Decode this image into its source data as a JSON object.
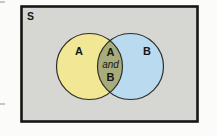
{
  "diagram": {
    "type": "venn-2-set",
    "sample_space_label": "S",
    "set_a_label": "A",
    "set_b_label": "B",
    "intersection_label_lines": [
      "A",
      "and",
      "B"
    ]
  },
  "colors": {
    "page_bg": "#fbfbf9",
    "sample_space_bg": "#d6d6d3",
    "sample_space_border": "#161616",
    "set_a_fill": "#f1e795",
    "set_b_fill": "#badaf0",
    "intersection_fill": "#a8ac7b",
    "circle_outline": "#2e2e2a",
    "label_color": "#161616"
  }
}
